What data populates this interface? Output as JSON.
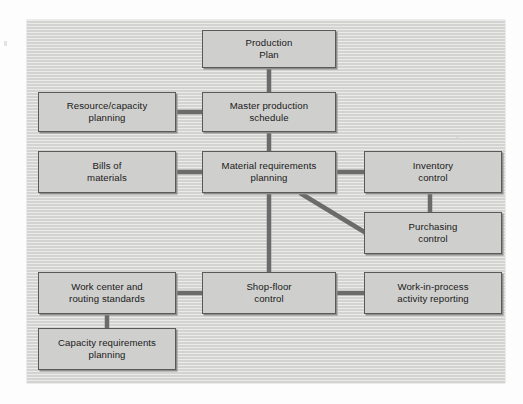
{
  "figure": {
    "type": "block-flow-diagram",
    "panel": {
      "background_color": "#d3d3d1",
      "texture": "horizontal-scanlines"
    },
    "node_style": {
      "fill_color": "#cfcfcd",
      "border_color": "#5a5a5a",
      "shadow_color": "#8d8d8b",
      "text_color": "#1a1a1a"
    },
    "connector_color": "#6b6b6b"
  },
  "nodes": [
    {
      "id": "production-plan",
      "label": "Production\nPlan",
      "x": 202,
      "y": 30,
      "w": 134,
      "h": 38
    },
    {
      "id": "resource-capacity-planning",
      "label": "Resource/capacity\nplanning",
      "x": 38,
      "y": 92,
      "w": 138,
      "h": 40
    },
    {
      "id": "master-production-schedule",
      "label": "Master production\nschedule",
      "x": 202,
      "y": 92,
      "w": 134,
      "h": 40
    },
    {
      "id": "bills-of-materials",
      "label": "Bills of\nmaterials",
      "x": 38,
      "y": 151,
      "w": 138,
      "h": 42
    },
    {
      "id": "material-requirements-planning",
      "label": "Material requirements\nplanning",
      "x": 202,
      "y": 151,
      "w": 134,
      "h": 42
    },
    {
      "id": "inventory-control",
      "label": "Inventory\ncontrol",
      "x": 364,
      "y": 151,
      "w": 138,
      "h": 42
    },
    {
      "id": "purchasing-control",
      "label": "Purchasing\ncontrol",
      "x": 364,
      "y": 212,
      "w": 138,
      "h": 42
    },
    {
      "id": "work-center-and-routing-standards",
      "label": "Work center and\nrouting standards",
      "x": 38,
      "y": 272,
      "w": 138,
      "h": 42
    },
    {
      "id": "shop-floor-control",
      "label": "Shop-floor\ncontrol",
      "x": 202,
      "y": 272,
      "w": 134,
      "h": 42
    },
    {
      "id": "work-in-process-activity-reporting",
      "label": "Work-in-process\nactivity reporting",
      "x": 364,
      "y": 272,
      "w": 138,
      "h": 42
    },
    {
      "id": "capacity-requirements-planning",
      "label": "Capacity requirements\nplanning",
      "x": 38,
      "y": 328,
      "w": 138,
      "h": 42
    }
  ],
  "connectors": [
    {
      "id": "production-plan-to-master-production-schedule",
      "from": "production-plan",
      "to": "master-production-schedule",
      "kind": "vertical",
      "x1": 269,
      "y1": 68,
      "x2": 269,
      "y2": 92
    },
    {
      "id": "resource-capacity-planning-to-master-production-schedule",
      "from": "resource-capacity-planning",
      "to": "master-production-schedule",
      "kind": "horizontal",
      "x1": 176,
      "y1": 112,
      "x2": 202,
      "y2": 112
    },
    {
      "id": "master-production-schedule-to-material-requirements-planning",
      "from": "master-production-schedule",
      "to": "material-requirements-planning",
      "kind": "vertical",
      "x1": 269,
      "y1": 132,
      "x2": 269,
      "y2": 151
    },
    {
      "id": "bills-of-materials-to-material-requirements-planning",
      "from": "bills-of-materials",
      "to": "material-requirements-planning",
      "kind": "horizontal",
      "x1": 176,
      "y1": 172,
      "x2": 202,
      "y2": 172
    },
    {
      "id": "material-requirements-planning-to-inventory-control",
      "from": "material-requirements-planning",
      "to": "inventory-control",
      "kind": "horizontal",
      "x1": 336,
      "y1": 172,
      "x2": 364,
      "y2": 172
    },
    {
      "id": "inventory-control-to-purchasing-control",
      "from": "inventory-control",
      "to": "purchasing-control",
      "kind": "vertical",
      "x1": 430,
      "y1": 193,
      "x2": 430,
      "y2": 212
    },
    {
      "id": "material-requirements-planning-to-purchasing-control",
      "from": "material-requirements-planning",
      "to": "purchasing-control",
      "kind": "diagonal",
      "x1": 300,
      "y1": 193,
      "x2": 366,
      "y2": 233
    },
    {
      "id": "material-requirements-planning-to-shop-floor-control",
      "from": "material-requirements-planning",
      "to": "shop-floor-control",
      "kind": "vertical",
      "x1": 269,
      "y1": 193,
      "x2": 269,
      "y2": 272
    },
    {
      "id": "work-center-and-routing-standards-to-shop-floor-control",
      "from": "work-center-and-routing-standards",
      "to": "shop-floor-control",
      "kind": "horizontal",
      "x1": 176,
      "y1": 293,
      "x2": 202,
      "y2": 293
    },
    {
      "id": "shop-floor-control-to-work-in-process-activity-reporting",
      "from": "shop-floor-control",
      "to": "work-in-process-activity-reporting",
      "kind": "horizontal",
      "x1": 336,
      "y1": 293,
      "x2": 364,
      "y2": 293
    },
    {
      "id": "work-center-and-routing-standards-to-capacity-requirements-planning",
      "from": "work-center-and-routing-standards",
      "to": "capacity-requirements-planning",
      "kind": "vertical",
      "x1": 107,
      "y1": 314,
      "x2": 107,
      "y2": 328
    }
  ]
}
